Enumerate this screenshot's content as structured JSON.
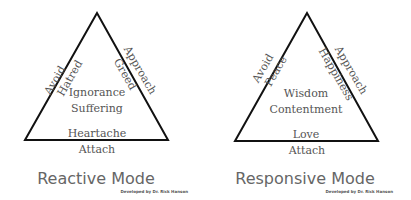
{
  "diagrams": [
    {
      "title": "Reactive Mode",
      "credit": "Developed by Dr. Rick Hanson",
      "left_side": {
        "outer": "Avoid",
        "inner": "Hatred"
      },
      "right_side": {
        "outer": "Approach",
        "inner": "Greed"
      },
      "center": [
        "Ignorance",
        "Suffering"
      ],
      "base_inner": "Heartache",
      "base_outer": "Attach"
    },
    {
      "title": "Responsive Mode",
      "credit": "Developed by Dr. Rick Hanson",
      "left_side": {
        "outer": "Avoid",
        "inner": "Peace"
      },
      "right_side": {
        "outer": "Approach",
        "inner": "Happiness"
      },
      "center": [
        "Wisdom",
        "Contentment"
      ],
      "base_inner": "Love",
      "base_outer": "Attach"
    }
  ],
  "colors": {
    "line": "#111111",
    "text": "#555555",
    "title": "#666666"
  }
}
